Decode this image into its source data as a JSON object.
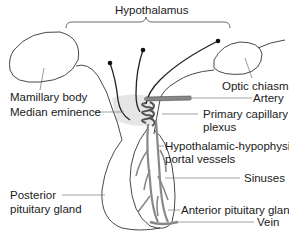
{
  "title": "Hypothalamus",
  "labels": {
    "hypothalamus": "Hypothalamus",
    "mamillary_body": "Mamillary body",
    "median_eminence": "Median eminence",
    "optic_chiasm": "Optic chiasm",
    "artery": "Artery",
    "primary_capillary_plexus_1": "Primary capillary",
    "primary_capillary_plexus_2": "plexus",
    "portal_vessels_1": "Hypothalamic-hypophysial",
    "portal_vessels_2": "portal vessels",
    "sinuses": "Sinuses",
    "posterior_pituitary_1": "Posterior",
    "posterior_pituitary_2": "pituitary gland",
    "anterior_pituitary": "Anterior pituitary gland",
    "vein": "Vein"
  }
}
